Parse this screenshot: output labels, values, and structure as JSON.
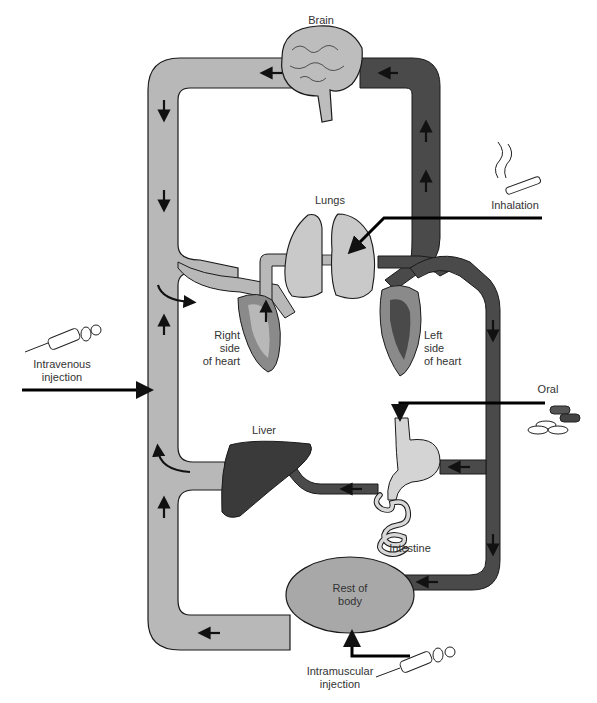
{
  "diagram": {
    "type": "drug-administration-circulation-diagram",
    "colors": {
      "venous": "#b8b8b8",
      "arterial": "#4a4a4a",
      "outline": "#1a1a1a",
      "organ_light": "#c9c9c9",
      "liver": "#3a3a3a",
      "body_oval": "#a8a8a8",
      "arrow": "#111111",
      "background": "#ffffff"
    },
    "organs": {
      "brain": "Brain",
      "lungs": "Lungs",
      "right_heart": "Right\nside\nof heart",
      "left_heart": "Left\nside\nof heart",
      "liver": "Liver",
      "intestine": "Intestine",
      "rest_of_body": "Rest of\nbody"
    },
    "routes": {
      "inhalation": "Inhalation",
      "intravenous": "Intravenous\ninjection",
      "oral": "Oral",
      "intramuscular": "Intramuscular\ninjection"
    }
  }
}
